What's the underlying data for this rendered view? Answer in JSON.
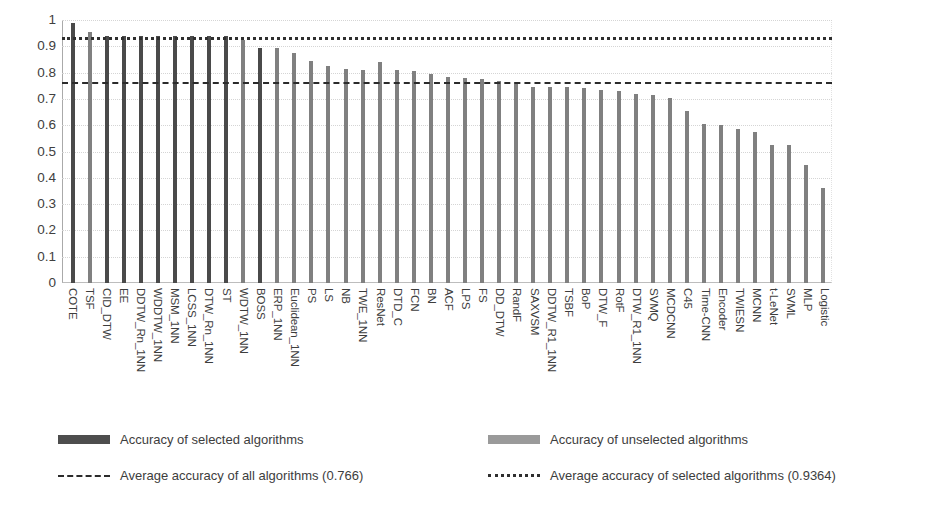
{
  "chart_data": {
    "type": "bar",
    "title": "",
    "xlabel": "",
    "ylabel": "",
    "ylim": [
      0,
      1
    ],
    "grid": true,
    "y_ticks": [
      "1",
      "0.9",
      "0.8",
      "0.7",
      "0.6",
      "0.5",
      "0.4",
      "0.3",
      "0.2",
      "0.1",
      "0"
    ],
    "y_tick_values": [
      1,
      0.9,
      0.8,
      0.7,
      0.6,
      0.5,
      0.4,
      0.3,
      0.2,
      0.1,
      0
    ],
    "categories": [
      "COTE",
      "TSF",
      "CID_DTW",
      "EE",
      "DDTW_Rn_1NN",
      "WDDTW_1NN",
      "MSM_1NN",
      "LCSS_1NN",
      "DTW_Rn_1NN",
      "ST",
      "WDTW_1NN",
      "BOSS",
      "ERP_1NN",
      "Euclidean_1NN",
      "PS",
      "LS",
      "NB",
      "TWE_1NN",
      "ResNet",
      "DTD_C",
      "FCN",
      "BN",
      "ACF",
      "LPS",
      "FS",
      "DD_DTW",
      "RandF",
      "SAXVSM",
      "DDTW_R1_1NN",
      "TSBF",
      "BoP",
      "DTW_F",
      "RotF",
      "DTW_R1_1NN",
      "SVMQ",
      "MCDCNN",
      "C45",
      "Time-CNN",
      "Encoder",
      "TWIESN",
      "MCNN",
      "t-LeNet",
      "SVML",
      "MLP",
      "Logistic"
    ],
    "values": [
      0.99,
      0.955,
      0.94,
      0.94,
      0.94,
      0.94,
      0.94,
      0.94,
      0.94,
      0.94,
      0.925,
      0.895,
      0.895,
      0.875,
      0.845,
      0.825,
      0.815,
      0.81,
      0.84,
      0.81,
      0.805,
      0.795,
      0.785,
      0.78,
      0.775,
      0.77,
      0.765,
      0.745,
      0.745,
      0.745,
      0.74,
      0.735,
      0.73,
      0.72,
      0.715,
      0.705,
      0.655,
      0.605,
      0.6,
      0.585,
      0.575,
      0.525,
      0.525,
      0.45,
      0.36
    ],
    "selected_flags": [
      true,
      false,
      true,
      true,
      true,
      true,
      true,
      true,
      true,
      true,
      false,
      true,
      false,
      false,
      false,
      false,
      false,
      false,
      false,
      false,
      false,
      false,
      false,
      false,
      false,
      false,
      false,
      false,
      false,
      false,
      false,
      false,
      false,
      false,
      false,
      false,
      false,
      false,
      false,
      false,
      false,
      false,
      false,
      false,
      false
    ],
    "reference_lines": [
      {
        "name": "average-all",
        "value": 0.766,
        "style": "dash-dot",
        "color": "#2b2b2b"
      },
      {
        "name": "average-selected",
        "value": 0.9364,
        "style": "dotted",
        "color": "#2f2f2f"
      }
    ],
    "legend_position": "bottom",
    "legend": [
      {
        "key": "selected-bars",
        "marker": "bar-dark",
        "label": "Accuracy of selected algorithms"
      },
      {
        "key": "unselected-bars",
        "marker": "bar-light",
        "label": "Accuracy of unselected algorithms"
      },
      {
        "key": "avg-all",
        "marker": "dash-dot",
        "label": "Average accuracy of all algorithms (0.766)"
      },
      {
        "key": "avg-selected",
        "marker": "dotted",
        "label": "Average accuracy of selected algorithms (0.9364)"
      }
    ],
    "colors": {
      "selected_bar": "#4a4a4a",
      "unselected_bar": "#808080",
      "avg_all_line": "#2b2b2b",
      "avg_selected_line": "#2f2f2f",
      "gridline": "#d5d5d5",
      "axis": "#aaaaaa",
      "text": "#3d3d3d",
      "background": "#ffffff"
    }
  }
}
